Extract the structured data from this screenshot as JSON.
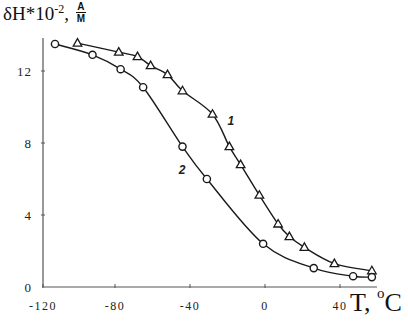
{
  "chart_data": {
    "type": "line",
    "title": "",
    "ylabel": "δH*10^-2, A/M",
    "ylabel_parts": {
      "main": "δH*10",
      "exp": "-2",
      "sep": ",",
      "unit_num": "A",
      "unit_den": "M"
    },
    "xlabel": "T, °C",
    "xlabel_parts": {
      "main": "T, ",
      "sup": "o",
      "unit": "C"
    },
    "xlim": [
      -120,
      60
    ],
    "ylim": [
      0,
      14
    ],
    "x_ticks": [
      -120,
      -80,
      -40,
      0,
      40
    ],
    "x_tick_labels": [
      "-120",
      "-80",
      "-40",
      "0",
      "40"
    ],
    "y_ticks": [
      0,
      4,
      8,
      12
    ],
    "y_tick_labels": [
      "0",
      "4",
      "8",
      "12"
    ],
    "grid": false,
    "legend": "inline curve labels",
    "series": [
      {
        "name": "1",
        "marker": "triangle",
        "label_pos": {
          "x": -20,
          "y": 9.0
        },
        "x": [
          -100,
          -78,
          -68,
          -61,
          -52,
          -44,
          -28,
          -19,
          -13,
          -3,
          7,
          13,
          21,
          37,
          57
        ],
        "y": [
          13.55,
          13.05,
          12.8,
          12.3,
          11.8,
          10.9,
          9.6,
          7.8,
          6.8,
          5.1,
          3.5,
          2.8,
          2.2,
          1.3,
          0.9
        ]
      },
      {
        "name": "2",
        "marker": "circle",
        "label_pos": {
          "x": -46,
          "y": 6.3
        },
        "x": [
          -112,
          -92,
          -77,
          -65,
          -44,
          -31,
          -1,
          26,
          47,
          57
        ],
        "y": [
          13.5,
          12.9,
          12.1,
          11.1,
          7.8,
          6.0,
          2.4,
          1.05,
          0.6,
          0.55
        ]
      }
    ]
  },
  "colors": {
    "line": "#1a1a1a",
    "axis": "#555555",
    "background": "#ffffff"
  }
}
